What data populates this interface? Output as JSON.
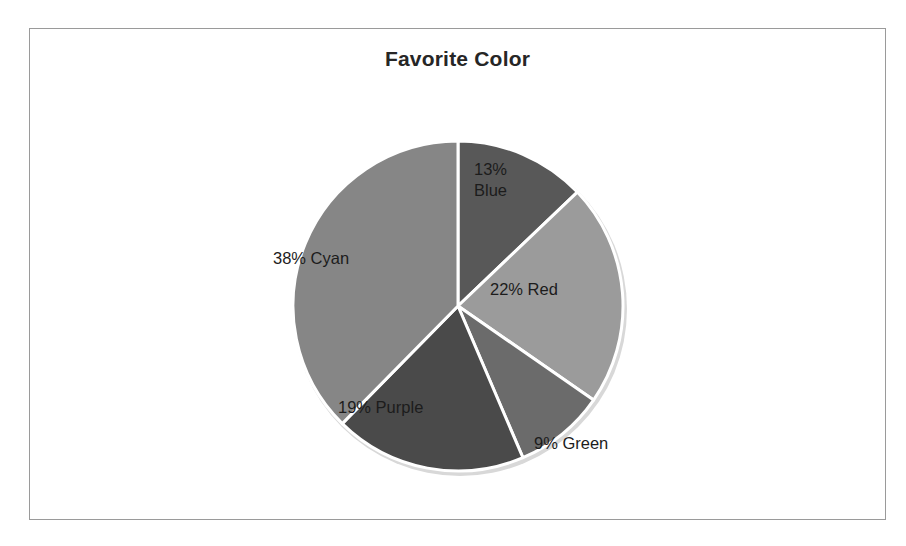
{
  "chart_data": {
    "type": "pie",
    "title": "Favorite Color",
    "categories": [
      "Blue",
      "Red",
      "Green",
      "Purple",
      "Cyan"
    ],
    "values": [
      13,
      22,
      9,
      19,
      38
    ],
    "unit": "%",
    "legend": "none",
    "labels_inside": true,
    "start_angle_deg": 0,
    "direction": "clockwise",
    "slices": [
      {
        "name": "Blue",
        "value": 13,
        "label": "13%\nBlue",
        "label_line1": "13%",
        "label_line2": "Blue",
        "color": "#585858",
        "label_x": 473,
        "label_y": 158,
        "outside": false
      },
      {
        "name": "Red",
        "value": 22,
        "label": "22% Red",
        "color": "#9b9b9b",
        "label_x": 489,
        "label_y": 278,
        "outside": false
      },
      {
        "name": "Green",
        "value": 9,
        "label": "9% Green",
        "color": "#6b6b6b",
        "label_x": 533,
        "label_y": 432,
        "outside": true
      },
      {
        "name": "Purple",
        "value": 19,
        "label": "19% Purple",
        "color": "#4a4a4a",
        "label_x": 337,
        "label_y": 396,
        "outside": false
      },
      {
        "name": "Cyan",
        "value": 38,
        "label": "38% Cyan",
        "color": "#868686",
        "label_x": 272,
        "label_y": 247,
        "outside": false
      }
    ],
    "geometry": {
      "center_x": 457,
      "center_y": 305,
      "radius": 165
    },
    "colors": {
      "plot_background": "#ffffff",
      "frame_border": "#9a9a9a",
      "slice_divider": "#ffffff",
      "title_text": "#262626",
      "label_text": "#1c1c1c"
    }
  }
}
